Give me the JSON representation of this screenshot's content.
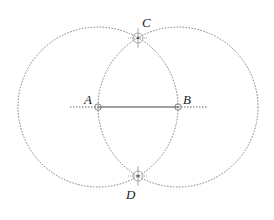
{
  "diagram": {
    "points": {
      "A": {
        "label": "A",
        "x": 98,
        "y": 107
      },
      "B": {
        "label": "B",
        "x": 178,
        "y": 107
      },
      "C": {
        "label": "C",
        "x": 138,
        "y": 38
      },
      "D": {
        "label": "D",
        "x": 138,
        "y": 176
      }
    },
    "circles": [
      {
        "center": "A",
        "radius": 80
      },
      {
        "center": "B",
        "radius": 80
      }
    ],
    "segment": {
      "from": "A",
      "to": "B",
      "style": "solid"
    },
    "extended_line": {
      "x1": 70,
      "x2": 207,
      "style": "dotted"
    },
    "colors": {
      "line": "#555555",
      "circle": "#777777",
      "label": "#222222"
    }
  }
}
